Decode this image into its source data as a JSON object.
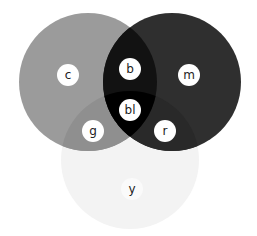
{
  "diagram": {
    "type": "venn",
    "canvas": {
      "width": 257,
      "height": 236,
      "background": "#ffffff"
    },
    "circles": [
      {
        "id": "cyan",
        "label": "c",
        "cx": 88,
        "cy": 82,
        "r": 69,
        "fill": "#9b9b9b"
      },
      {
        "id": "magenta",
        "label": "m",
        "cx": 172,
        "cy": 82,
        "r": 69,
        "fill": "#2f2f2f"
      },
      {
        "id": "yellow",
        "label": "y",
        "cx": 130,
        "cy": 160,
        "r": 69,
        "fill": "#f3f3f3"
      }
    ],
    "regions": {
      "cyan_magenta": {
        "label": "b",
        "fill": "#121212"
      },
      "cyan_yellow": {
        "label": "g",
        "fill": "#8f8f8f"
      },
      "magenta_yellow": {
        "label": "r",
        "fill": "#292929"
      },
      "all_three": {
        "label": "bl",
        "fill": "#000000"
      }
    },
    "labels": [
      {
        "id": "c",
        "text": "c",
        "x": 68,
        "y": 75,
        "r": 11,
        "badge": "#ffffff"
      },
      {
        "id": "m",
        "text": "m",
        "x": 189,
        "y": 75,
        "r": 11,
        "badge": "#ffffff"
      },
      {
        "id": "b",
        "text": "b",
        "x": 130,
        "y": 69,
        "r": 11,
        "badge": "#ffffff"
      },
      {
        "id": "bl",
        "text": "bl",
        "x": 130,
        "y": 110,
        "r": 11,
        "badge": "#ffffff"
      },
      {
        "id": "g",
        "text": "g",
        "x": 93,
        "y": 131,
        "r": 11,
        "badge": "#ffffff"
      },
      {
        "id": "r",
        "text": "r",
        "x": 165,
        "y": 131,
        "r": 11,
        "badge": "#ffffff"
      },
      {
        "id": "y",
        "text": "y",
        "x": 132,
        "y": 189,
        "r": 11,
        "badge": "#fafafa"
      }
    ]
  }
}
